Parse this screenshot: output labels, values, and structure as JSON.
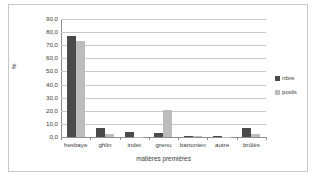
{
  "chart_data": {
    "type": "bar",
    "title": "",
    "xlabel": "matières premières",
    "ylabel": "%",
    "ylim": [
      0,
      90
    ],
    "ytick_step": 10,
    "ytick_labels": [
      "0,0",
      "10,0",
      "20,0",
      "30,0",
      "40,0",
      "50,0",
      "60,0",
      "70,0",
      "80,0",
      "90,0"
    ],
    "grid": true,
    "legend_position": "right",
    "categories": [
      "hesbaye",
      "ghlin",
      "indet",
      "grenu",
      "bartonien",
      "autre",
      "brûlés"
    ],
    "series": [
      {
        "name": "nbre",
        "color": "#4a4a4a",
        "values": [
          77.0,
          6.5,
          3.5,
          3.3,
          0.4,
          0.4,
          6.5
        ]
      },
      {
        "name": "poids",
        "color": "#bcbcbc",
        "values": [
          73.0,
          2.0,
          0.2,
          20.5,
          0.5,
          0.2,
          2.0
        ]
      }
    ]
  },
  "legend": {
    "items": [
      {
        "label": "nbre"
      },
      {
        "label": "poids"
      }
    ]
  },
  "colors": {
    "series_nbre": "#4a4a4a",
    "series_poids": "#bcbcbc",
    "gridline": "#c9c9c9",
    "axis": "#8d8d8d",
    "frame": "#c8c8c8",
    "text": "#3d3d3d",
    "background": "#ffffff"
  }
}
